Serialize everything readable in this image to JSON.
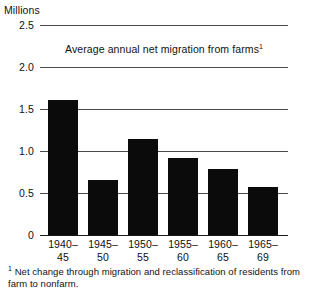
{
  "chart_data": {
    "type": "bar",
    "title": "Average annual net migration from farms",
    "title_footnote_marker": "1",
    "unit_label": "Millions",
    "xlabel": "",
    "ylabel": "Millions",
    "ylim": [
      0,
      2.5
    ],
    "ytick_values": [
      2.5,
      2.0,
      1.5,
      1.0,
      0.5,
      0
    ],
    "ytick_labels": [
      "2.5",
      "2.0",
      "1.5",
      "1.0",
      "0.5",
      "0"
    ],
    "grid": true,
    "legend": "none",
    "categories": [
      "1940-45",
      "1945-50",
      "1950-55",
      "1955-60",
      "1960-65",
      "1965-69"
    ],
    "category_lines": [
      [
        "1940–",
        "45"
      ],
      [
        "1945–",
        "50"
      ],
      [
        "1950–",
        "55"
      ],
      [
        "1955–",
        "60"
      ],
      [
        "1960–",
        "65"
      ],
      [
        "1965–",
        "69"
      ]
    ],
    "values": [
      1.61,
      0.66,
      1.14,
      0.92,
      0.78,
      0.57
    ],
    "bar_color": "#0b0b0b",
    "background_color": "#ffffff"
  },
  "footnote": {
    "marker": "1",
    "text": "Net change through migration and reclassification of residents from farm to nonfarm."
  }
}
